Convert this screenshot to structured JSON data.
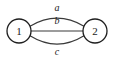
{
  "diagram": {
    "kind": "multigraph",
    "background_color": "#ffffff",
    "node_stroke_color": "#1f1f1f",
    "edge_stroke_color": "#3a3a3a",
    "label_color": "#1a1a1a",
    "nodes": [
      {
        "id": "1",
        "label": "1",
        "cx": 19,
        "cy": 31,
        "r": 12
      },
      {
        "id": "2",
        "label": "2",
        "cx": 95,
        "cy": 31,
        "r": 12
      }
    ],
    "edges": [
      {
        "id": "edge-a",
        "label": "a",
        "from": "1",
        "to": "2",
        "shape": "arc-up",
        "path": "M 30.0 26.2 Q 57 10.0 84.0 26.2",
        "label_x": 57,
        "label_y": 7
      },
      {
        "id": "edge-b",
        "label": "b",
        "from": "1",
        "to": "2",
        "shape": "straight",
        "path": "M 31.0 31.0 L 83.0 31.0",
        "label_x": 57,
        "label_y": 20
      },
      {
        "id": "edge-c",
        "label": "c",
        "from": "1",
        "to": "2",
        "shape": "arc-down",
        "path": "M 30.0 35.8 Q 57 52.5 84.0 35.8",
        "label_x": 57,
        "label_y": 51
      }
    ]
  }
}
